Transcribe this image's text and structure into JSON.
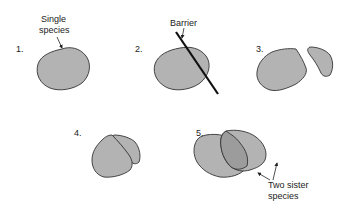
{
  "diagram": {
    "steps": [
      {
        "number": "1.",
        "label_line1": "Single",
        "label_line2": "species"
      },
      {
        "number": "2.",
        "label": "Barrier"
      },
      {
        "number": "3."
      },
      {
        "number": "4."
      },
      {
        "number": "5.",
        "label_line1": "Two sister",
        "label_line2": "species"
      }
    ],
    "colors": {
      "fill": "#b3b3b3",
      "overlap_fill": "#9c9c9c",
      "stroke": "#333333",
      "barrier": "#111111"
    }
  }
}
